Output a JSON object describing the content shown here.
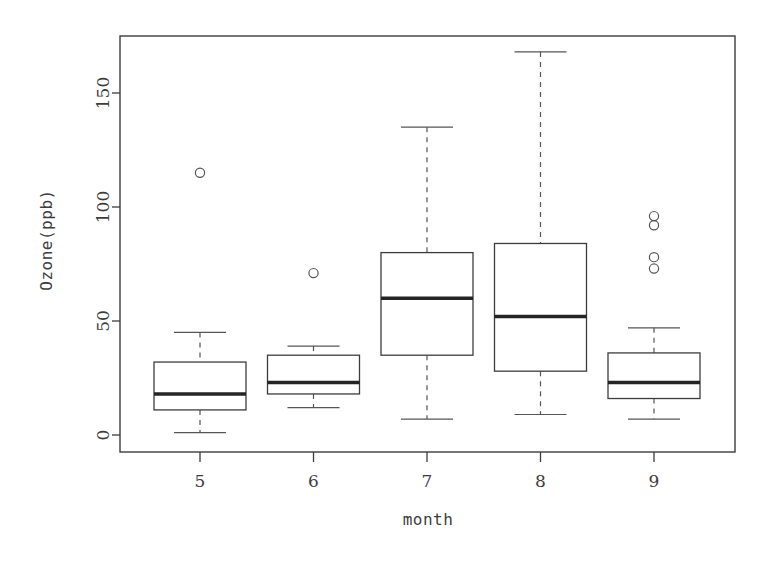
{
  "chart_data": {
    "type": "box",
    "title": "",
    "xlabel": "month",
    "ylabel": "Ozone(ppb)",
    "categories": [
      "5",
      "6",
      "7",
      "8",
      "9"
    ],
    "xtick_labels": [
      "5",
      "6",
      "7",
      "8",
      "9"
    ],
    "ytick_labels": [
      "0",
      "50",
      "100",
      "150"
    ],
    "yticks": [
      0,
      50,
      100,
      150
    ],
    "ylim": [
      -5,
      175
    ],
    "grid": false,
    "legend": null,
    "boxes": [
      {
        "category": "5",
        "whisker_low": 1,
        "q1": 11,
        "median": 18,
        "q3": 32,
        "whisker_high": 45,
        "outliers": [
          115
        ]
      },
      {
        "category": "6",
        "whisker_low": 12,
        "q1": 18,
        "median": 23,
        "q3": 35,
        "whisker_high": 39,
        "outliers": [
          71
        ]
      },
      {
        "category": "7",
        "whisker_low": 7,
        "q1": 35,
        "median": 60,
        "q3": 80,
        "whisker_high": 135,
        "outliers": []
      },
      {
        "category": "8",
        "whisker_low": 9,
        "q1": 28,
        "median": 52,
        "q3": 84,
        "whisker_high": 168,
        "outliers": []
      },
      {
        "category": "9",
        "whisker_low": 7,
        "q1": 16,
        "median": 23,
        "q3": 36,
        "whisker_high": 47,
        "outliers": [
          96,
          92,
          78,
          73
        ]
      }
    ]
  },
  "axes": {
    "x_title": "month",
    "y_title": "Ozone(ppb)"
  }
}
